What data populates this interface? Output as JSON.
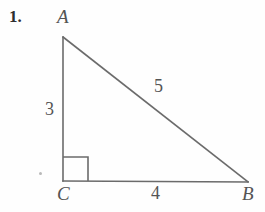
{
  "figure": {
    "problem_number": "1.",
    "canvas": {
      "width": 265,
      "height": 212
    },
    "stroke_color": "#6b6b6b",
    "text_color": "#545454",
    "background_color": "#fefefe",
    "vertices": [
      {
        "name": "A",
        "label": "A",
        "x": 63,
        "y": 37
      },
      {
        "name": "C",
        "label": "C",
        "x": 63,
        "y": 181
      },
      {
        "name": "B",
        "label": "B",
        "x": 248,
        "y": 182
      }
    ],
    "sides": [
      {
        "name": "leg-vertical",
        "from": "A",
        "to": "C",
        "length_label": "3"
      },
      {
        "name": "leg-horizontal",
        "from": "C",
        "to": "B",
        "length_label": "4"
      },
      {
        "name": "hypotenuse",
        "from": "A",
        "to": "B",
        "length_label": "5"
      }
    ],
    "right_angle": {
      "at_vertex": "C",
      "marker": "square",
      "size": 25
    },
    "artifact": {
      "name": "speck",
      "x": 41,
      "y": 174
    }
  }
}
